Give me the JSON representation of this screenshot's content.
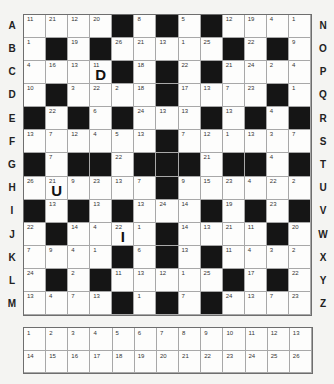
{
  "puzzle": {
    "left_labels": [
      "A",
      "B",
      "C",
      "D",
      "E",
      "F",
      "G",
      "H",
      "I",
      "J",
      "K",
      "L",
      "M"
    ],
    "right_labels": [
      "N",
      "O",
      "P",
      "Q",
      "R",
      "S",
      "T",
      "U",
      "V",
      "W",
      "X",
      "Y",
      "Z"
    ],
    "grid": [
      [
        11,
        21,
        12,
        20,
        null,
        8,
        null,
        5,
        null,
        12,
        19,
        4,
        1
      ],
      [
        1,
        null,
        19,
        null,
        26,
        21,
        13,
        1,
        25,
        null,
        22,
        null,
        9
      ],
      [
        4,
        16,
        13,
        11,
        null,
        18,
        null,
        22,
        null,
        21,
        24,
        2,
        4
      ],
      [
        10,
        null,
        3,
        22,
        2,
        18,
        null,
        17,
        13,
        7,
        23,
        null,
        1
      ],
      [
        null,
        22,
        null,
        6,
        null,
        24,
        13,
        13,
        null,
        13,
        null,
        4,
        null
      ],
      [
        13,
        7,
        12,
        4,
        5,
        13,
        null,
        7,
        12,
        1,
        13,
        3,
        7
      ],
      [
        null,
        7,
        null,
        null,
        22,
        null,
        null,
        null,
        21,
        null,
        null,
        4,
        null
      ],
      [
        26,
        21,
        9,
        23,
        13,
        7,
        null,
        9,
        15,
        23,
        4,
        22,
        2
      ],
      [
        null,
        13,
        null,
        13,
        null,
        13,
        24,
        14,
        null,
        19,
        null,
        23,
        null
      ],
      [
        22,
        null,
        14,
        4,
        22,
        1,
        null,
        14,
        13,
        21,
        11,
        null,
        20
      ],
      [
        7,
        9,
        4,
        1,
        null,
        6,
        null,
        13,
        null,
        11,
        4,
        3,
        2
      ],
      [
        24,
        null,
        2,
        null,
        11,
        13,
        12,
        1,
        25,
        null,
        17,
        null,
        22
      ],
      [
        13,
        4,
        7,
        13,
        null,
        1,
        null,
        7,
        null,
        24,
        13,
        7,
        23
      ]
    ],
    "given_letters": [
      {
        "row": 2,
        "col": 3,
        "letter": "D"
      },
      {
        "row": 7,
        "col": 1,
        "letter": "U"
      },
      {
        "row": 9,
        "col": 4,
        "letter": "I"
      }
    ],
    "key": {
      "row1": [
        1,
        2,
        3,
        4,
        5,
        6,
        7,
        8,
        9,
        10,
        11,
        12,
        13
      ],
      "row2": [
        14,
        15,
        16,
        17,
        18,
        19,
        20,
        21,
        22,
        23,
        24,
        25,
        26
      ]
    }
  }
}
